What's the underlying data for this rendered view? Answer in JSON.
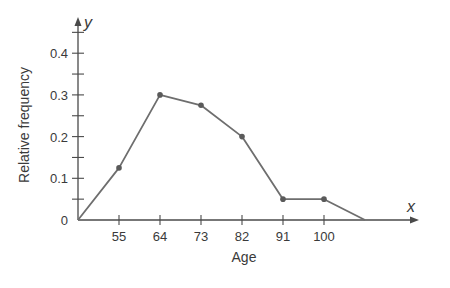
{
  "chart_data": {
    "type": "line",
    "title": "",
    "xlabel": "Age",
    "ylabel": "Relative frequency",
    "x_axis_var": "x",
    "y_axis_var": "y",
    "x_tick_labels": [
      "55",
      "64",
      "73",
      "82",
      "91",
      "100"
    ],
    "y_tick_labels": [
      "0",
      "0.1",
      "0.2",
      "0.3",
      "0.4"
    ],
    "ylim": [
      0,
      0.45
    ],
    "grid": false,
    "legend": null,
    "series": [
      {
        "name": "Relative frequency polygon",
        "x": [
          46,
          55,
          64,
          73,
          82,
          91,
          100,
          109
        ],
        "values": [
          0,
          0.125,
          0.3,
          0.275,
          0.2,
          0.05,
          0.05,
          0
        ],
        "markers_at": [
          55,
          64,
          73,
          82,
          91,
          100
        ]
      }
    ],
    "colors": {
      "line": "#6e6e6e",
      "axis": "#4a4a4a",
      "marker": "#5a5a5a"
    }
  }
}
